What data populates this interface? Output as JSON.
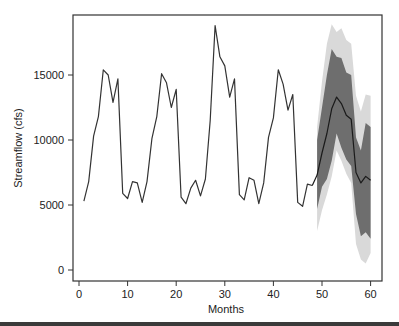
{
  "chart_data": {
    "type": "line",
    "title": "",
    "xlabel": "Months",
    "ylabel": "Streamflow (cfs)",
    "xlim": [
      -0.5,
      62
    ],
    "ylim": [
      -800,
      19700
    ],
    "x_ticks": [
      0,
      10,
      20,
      30,
      40,
      50,
      60
    ],
    "y_ticks": [
      0,
      5000,
      10000,
      15000
    ],
    "y_tick_labels": [
      "0",
      "5000",
      "10000",
      "15000"
    ],
    "grid": false,
    "legend": null,
    "series": [
      {
        "name": "Observed streamflow",
        "style": "line",
        "color": "#333333",
        "x": [
          1,
          2,
          3,
          4,
          5,
          6,
          7,
          8,
          9,
          10,
          11,
          12,
          13,
          14,
          15,
          16,
          17,
          18,
          19,
          20,
          21,
          22,
          23,
          24,
          25,
          26,
          27,
          28,
          29,
          30,
          31,
          32,
          33,
          34,
          35,
          36,
          37,
          38,
          39,
          40,
          41,
          42,
          43,
          44,
          45,
          46,
          47,
          48
        ],
        "values": [
          5300,
          6800,
          10300,
          11800,
          15400,
          15000,
          12900,
          14700,
          5900,
          5500,
          6800,
          6700,
          5200,
          6800,
          10100,
          11800,
          15100,
          14400,
          12500,
          13900,
          5600,
          5100,
          6300,
          6900,
          5700,
          7000,
          11500,
          18800,
          16400,
          15700,
          13300,
          14700,
          5800,
          5400,
          7100,
          6900,
          5100,
          6700,
          10200,
          11700,
          15400,
          14300,
          12300,
          13500,
          5200,
          4900,
          6600,
          6500
        ]
      },
      {
        "name": "Forecast median",
        "style": "line",
        "color": "#1a1a1a",
        "x": [
          48,
          49,
          50,
          51,
          52,
          53,
          54,
          55,
          56,
          57,
          58,
          59,
          60
        ],
        "values": [
          6500,
          7300,
          9000,
          10500,
          12400,
          13300,
          12800,
          11900,
          11600,
          7500,
          6700,
          7200,
          6900
        ]
      },
      {
        "name": "Inner prediction band",
        "style": "band",
        "color": "#6e6e6e",
        "x": [
          49,
          50,
          51,
          52,
          53,
          54,
          55,
          56,
          57,
          58,
          59,
          60
        ],
        "lower": [
          4700,
          6400,
          7000,
          8400,
          10500,
          9400,
          8500,
          8000,
          4300,
          2600,
          2900,
          2400
        ],
        "upper": [
          10000,
          12500,
          15000,
          17000,
          16400,
          16300,
          15200,
          15000,
          10200,
          9200,
          11300,
          11000
        ]
      },
      {
        "name": "Outer prediction band",
        "style": "band",
        "color": "#d9d9d9",
        "x": [
          49,
          50,
          51,
          52,
          53,
          54,
          55,
          56,
          57,
          58,
          59,
          60
        ],
        "lower": [
          3000,
          4600,
          5800,
          7200,
          9200,
          8400,
          7400,
          6700,
          2000,
          800,
          500,
          1300
        ],
        "upper": [
          11000,
          14500,
          17400,
          18900,
          18300,
          18600,
          17700,
          17400,
          13400,
          12200,
          13500,
          13400
        ]
      }
    ]
  },
  "axes": {
    "x_title": "Months",
    "y_title": "Streamflow (cfs)",
    "x_tick_labels": [
      "0",
      "10",
      "20",
      "30",
      "40",
      "50",
      "60"
    ],
    "y_tick_labels": [
      "0",
      "5000",
      "10000",
      "15000"
    ]
  },
  "colors": {
    "observed_line": "#333333",
    "forecast_line": "#1a1a1a",
    "inner_band": "#6e6e6e",
    "outer_band": "#d9d9d9",
    "axis": "#333333"
  }
}
